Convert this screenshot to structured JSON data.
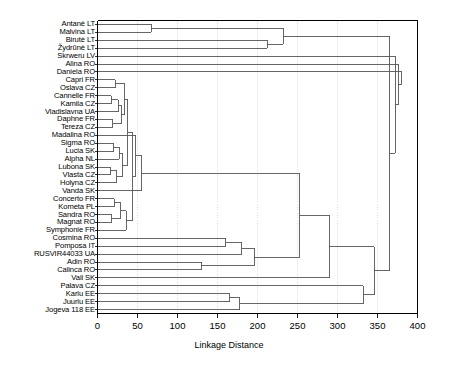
{
  "chart_data": {
    "type": "dendrogram",
    "title": "",
    "xlabel": "Linkage Distance",
    "ylabel": "",
    "xlim": [
      0,
      400
    ],
    "xticks": [
      0,
      50,
      100,
      150,
      200,
      250,
      300,
      350,
      400
    ],
    "xticklabels": [
      "0",
      "50",
      "100",
      "150",
      "200",
      "250",
      "300",
      "350",
      "400"
    ],
    "grid": true,
    "orientation": "horizontal",
    "leaf_labels": [
      "Antanė LT",
      "Malvina LT",
      "Birutė LT",
      "Žydrūnė LT",
      "Skrweru LV",
      "Alina RO",
      "Daniela RO",
      "Capri FR",
      "Oslava CZ",
      "Cannelle FR",
      "Kamila CZ",
      "Vladislavna UA",
      "Daphne FR",
      "Tereza CZ",
      "Madalina RO",
      "Sigma RO",
      "Lucia SK",
      "Alpha NL",
      "Lubona SK",
      "Vlasta CZ",
      "Holyna CZ",
      "Vanda SK",
      "Concerto FR",
      "Kometa PL",
      "Sandra RO",
      "Magnat RO",
      "Symphonie FR",
      "Cosmina RO",
      "Pomposa IT",
      "RUSVIR44033 UA",
      "Adin RO",
      "Calinca RO",
      "Vali SK",
      "Palava CZ",
      "Karlu EE",
      "Juurlu EE",
      "Jogeva 118 EE"
    ],
    "merges": [
      {
        "id": "m1",
        "left": "leaf:0",
        "right": "leaf:1",
        "distance": 67
      },
      {
        "id": "m2",
        "left": "leaf:2",
        "right": "leaf:3",
        "distance": 212
      },
      {
        "id": "m3",
        "left": "m1",
        "right": "m2",
        "distance": 232
      },
      {
        "id": "m4",
        "left": "leaf:7",
        "right": "leaf:8",
        "distance": 22
      },
      {
        "id": "m5",
        "left": "leaf:9",
        "right": "leaf:10",
        "distance": 17
      },
      {
        "id": "m6",
        "left": "m5",
        "right": "leaf:11",
        "distance": 26
      },
      {
        "id": "m7",
        "left": "leaf:12",
        "right": "leaf:13",
        "distance": 19
      },
      {
        "id": "m8",
        "left": "m6",
        "right": "m7",
        "distance": 30
      },
      {
        "id": "m9",
        "left": "m4",
        "right": "m8",
        "distance": 34
      },
      {
        "id": "m10",
        "left": "leaf:15",
        "right": "leaf:16",
        "distance": 20
      },
      {
        "id": "m11",
        "left": "m10",
        "right": "leaf:17",
        "distance": 27
      },
      {
        "id": "m12",
        "left": "leaf:18",
        "right": "leaf:19",
        "distance": 16
      },
      {
        "id": "m13",
        "left": "m12",
        "right": "leaf:20",
        "distance": 24
      },
      {
        "id": "m14",
        "left": "m11",
        "right": "m13",
        "distance": 31
      },
      {
        "id": "m15",
        "left": "m9",
        "right": "m14",
        "distance": 38
      },
      {
        "id": "m16",
        "left": "leaf:22",
        "right": "leaf:23",
        "distance": 21
      },
      {
        "id": "m17",
        "left": "leaf:24",
        "right": "leaf:25",
        "distance": 18
      },
      {
        "id": "m18",
        "left": "m16",
        "right": "m17",
        "distance": 29
      },
      {
        "id": "m19",
        "left": "m18",
        "right": "leaf:26",
        "distance": 36
      },
      {
        "id": "m20",
        "left": "m15",
        "right": "m19",
        "distance": 44
      },
      {
        "id": "m21",
        "left": "m20",
        "right": "leaf:14",
        "distance": 48
      },
      {
        "id": "m22",
        "left": "m21",
        "right": "leaf:21",
        "distance": 55
      },
      {
        "id": "m23",
        "left": "leaf:27",
        "right": "leaf:28",
        "distance": 160
      },
      {
        "id": "m24",
        "left": "m23",
        "right": "leaf:29",
        "distance": 180
      },
      {
        "id": "m25",
        "left": "leaf:30",
        "right": "leaf:31",
        "distance": 130
      },
      {
        "id": "m26",
        "left": "m25",
        "right": "m24",
        "distance": 196
      },
      {
        "id": "m27",
        "left": "m22",
        "right": "m26",
        "distance": 253
      },
      {
        "id": "m28",
        "left": "m27",
        "right": "leaf:32",
        "distance": 290
      },
      {
        "id": "m29",
        "left": "leaf:34",
        "right": "leaf:35",
        "distance": 165
      },
      {
        "id": "m30",
        "left": "m29",
        "right": "leaf:36",
        "distance": 178
      },
      {
        "id": "m31",
        "left": "m30",
        "right": "leaf:33",
        "distance": 332
      },
      {
        "id": "m32",
        "left": "m28",
        "right": "m31",
        "distance": 346
      },
      {
        "id": "m33",
        "left": "m3",
        "right": "m32",
        "distance": 365
      },
      {
        "id": "m34",
        "left": "m33",
        "right": "leaf:4",
        "distance": 372
      },
      {
        "id": "m35",
        "left": "m34",
        "right": "leaf:5",
        "distance": 376
      },
      {
        "id": "m36",
        "left": "m35",
        "right": "leaf:6",
        "distance": 380
      }
    ],
    "line_color": "#555555",
    "frame_color": "#000000",
    "grid_color": "#cccccc"
  }
}
